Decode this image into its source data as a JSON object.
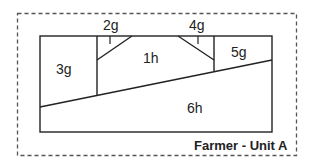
{
  "diagram": {
    "title": "Farmer - Unit A",
    "colors": {
      "line": "#222222",
      "dashed_border": "#555555",
      "background": "#ffffff"
    },
    "regions": [
      {
        "id": "1h",
        "label": "1h"
      },
      {
        "id": "2g",
        "label": "2g"
      },
      {
        "id": "3g",
        "label": "3g"
      },
      {
        "id": "4g",
        "label": "4g"
      },
      {
        "id": "5g",
        "label": "5g"
      },
      {
        "id": "6h",
        "label": "6h"
      }
    ]
  }
}
